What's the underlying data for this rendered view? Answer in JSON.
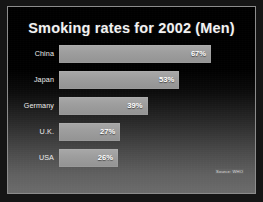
{
  "slide": {
    "title": "Smoking rates for 2002 (Men)",
    "source_note": "Source: WHO",
    "background_top_color": "#000000",
    "background_bottom_color": "#6b6b6b",
    "border_color": "#8c8c8c",
    "bar_color": "#9d9d9d",
    "title_color": "#f2f2f2",
    "label_color": "#ededed",
    "value_color": "#ffffff"
  },
  "chart_data": {
    "type": "bar",
    "orientation": "horizontal",
    "title": "Smoking rates for 2002 (Men)",
    "xlabel": "",
    "ylabel": "",
    "xlim": [
      0,
      75
    ],
    "grid": false,
    "legend": false,
    "annotations": [
      "Source: WHO"
    ],
    "categories": [
      "China",
      "Japan",
      "Germany",
      "U.K.",
      "USA"
    ],
    "values": [
      67,
      53,
      39,
      27,
      26
    ],
    "value_labels": [
      "67%",
      "53%",
      "39%",
      "27%",
      "26%"
    ],
    "unit": "%",
    "rows": [
      {
        "category": "China",
        "value": 67,
        "label": "67%"
      },
      {
        "category": "Japan",
        "value": 53,
        "label": "53%"
      },
      {
        "category": "Germany",
        "value": 39,
        "label": "39%"
      },
      {
        "category": "U.K.",
        "value": 27,
        "label": "27%"
      },
      {
        "category": "USA",
        "value": 26,
        "label": "26%"
      }
    ]
  }
}
